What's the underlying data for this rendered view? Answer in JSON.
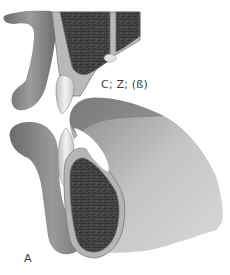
{
  "figure": {
    "type": "anatomical-illustration",
    "annotations": {
      "joint_label": "C; Z; (ß)",
      "panel_label": "A"
    },
    "colors": {
      "bone_dark": "#5f5f5f",
      "bone_mid": "#8a8a8a",
      "bone_light": "#c9c9c9",
      "cortex": "#b5b5b5",
      "cancellous": "#3f3f3f",
      "cartilage": "#e2e2e2",
      "background": "#ffffff"
    }
  }
}
